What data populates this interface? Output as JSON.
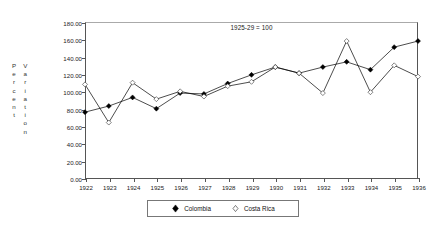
{
  "chart_data": {
    "type": "line",
    "title": "1925-29 = 100",
    "xlabel": "",
    "ylabel": "Percent Variation",
    "ylabel_col1": "Percent",
    "ylabel_col2": "Variation",
    "categories": [
      "1922",
      "1923",
      "1924",
      "1925",
      "1926",
      "1927",
      "1928",
      "1929",
      "1930",
      "1931",
      "1932",
      "1933",
      "1934",
      "1935",
      "1936"
    ],
    "x": [
      1922,
      1923,
      1924,
      1925,
      1926,
      1927,
      1928,
      1929,
      1930,
      1931,
      1932,
      1933,
      1934,
      1935,
      1936
    ],
    "series": [
      {
        "name": "Colombia",
        "marker": "filled-diamond",
        "color": "#000000",
        "values": [
          76,
          83,
          93,
          80,
          98,
          97,
          109,
          119,
          128,
          121,
          128,
          134,
          125,
          151,
          158
        ]
      },
      {
        "name": "Costa Rica",
        "marker": "hollow-diamond",
        "color": "#000000",
        "values": [
          108,
          64,
          110,
          91,
          100,
          94,
          106,
          111,
          128,
          121,
          98,
          158,
          99,
          130,
          117
        ]
      }
    ],
    "ylim": [
      0,
      180
    ],
    "yticks": [
      0,
      20,
      40,
      60,
      80,
      100,
      120,
      140,
      160,
      180
    ],
    "ytick_labels": [
      "0.00",
      "20.00",
      "40.00",
      "60.00",
      "80.00",
      "100.00",
      "120.00",
      "140.00",
      "160.00",
      "180.00"
    ],
    "grid": false,
    "legend_position": "bottom-center",
    "axis_color": "#555555"
  },
  "legend": {
    "entries": [
      {
        "label": "Colombia",
        "marker": "filled-diamond"
      },
      {
        "label": "Costa Rica",
        "marker": "hollow-diamond"
      }
    ]
  }
}
